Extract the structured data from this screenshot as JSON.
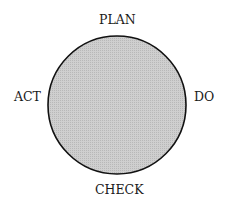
{
  "diagram": {
    "type": "cycle",
    "labels": {
      "top": "PLAN",
      "right": "DO",
      "bottom": "CHECK",
      "left": "ACT"
    },
    "colors": {
      "fill": "#c9c9c9",
      "stroke": "#111111"
    }
  }
}
